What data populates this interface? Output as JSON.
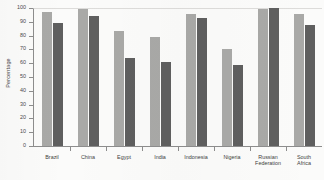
{
  "chart_data": {
    "type": "bar",
    "title": "",
    "xlabel": "",
    "ylabel": "Percentage",
    "ylim": [
      0,
      100
    ],
    "yticks": [
      0,
      10,
      20,
      30,
      40,
      50,
      60,
      70,
      80,
      90,
      100
    ],
    "grid": false,
    "legend": "none",
    "categories": [
      "Brazil",
      "China",
      "Egypt",
      "India",
      "Indonesia",
      "Nigeria",
      "Russian Federation",
      "South Africa"
    ],
    "series": [
      {
        "name": "series-1",
        "color": "#a9a9a7",
        "values": [
          97,
          99,
          83,
          79,
          96,
          70,
          99,
          96
        ]
      },
      {
        "name": "series-2",
        "color": "#5f5f5f",
        "values": [
          89,
          94,
          64,
          61,
          93,
          59,
          100,
          88
        ]
      }
    ]
  },
  "axis": {
    "y_title": "Percentage",
    "tick_labels": [
      "100",
      "90",
      "80",
      "70",
      "60",
      "50",
      "40",
      "30",
      "20",
      "10",
      "0"
    ]
  },
  "categories_display": [
    {
      "line1": "Brazil",
      "line2": ""
    },
    {
      "line1": "China",
      "line2": ""
    },
    {
      "line1": "Egypt",
      "line2": ""
    },
    {
      "line1": "India",
      "line2": ""
    },
    {
      "line1": "Indonesia",
      "line2": ""
    },
    {
      "line1": "Nigeria",
      "line2": ""
    },
    {
      "line1": "Russian",
      "line2": "Federation"
    },
    {
      "line1": "South",
      "line2": "Africa"
    }
  ]
}
